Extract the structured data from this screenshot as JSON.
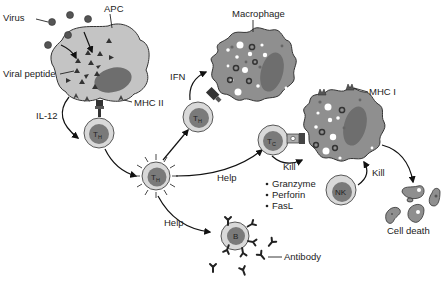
{
  "diagram": {
    "colors": {
      "cell_body": "#c4c4c4",
      "macrophage_body": "#8f8f8f",
      "nucleus": "#6e6e6e",
      "lymphocyte_outer": "#d9d9d9",
      "lymphocyte_inner": "#7a7a7a",
      "outline": "#333333",
      "text": "#222222"
    },
    "labels": {
      "virus": "Virus",
      "apc": "APC",
      "viral_peptide": "Viral peptide",
      "mhc2": "MHC II",
      "il12": "IL-12",
      "ifn": "IFN",
      "macrophage": "Macrophage",
      "mhc1": "MHC I",
      "help_tc": "Help",
      "help_b": "Help",
      "kill_tc": "Kill",
      "kill_nk": "Kill",
      "antibody": "Antibody",
      "cell_death": "Cell death"
    },
    "cells": {
      "th_naive": {
        "main": "T",
        "sub": "H"
      },
      "th_active": {
        "main": "T",
        "sub": "H"
      },
      "th_macrophage": {
        "main": "T",
        "sub": "H"
      },
      "tc": {
        "main": "T",
        "sub": "C"
      },
      "nk": {
        "main": "NK"
      },
      "b": {
        "main": "B"
      }
    },
    "effector_molecules": [
      "Granzyme",
      "Perforin",
      "FasL"
    ]
  }
}
